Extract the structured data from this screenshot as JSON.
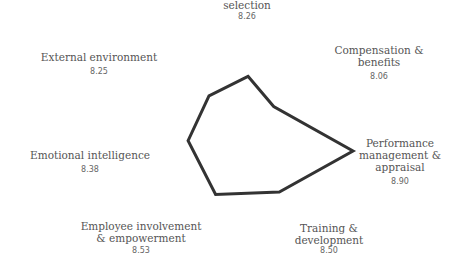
{
  "chart_data": {
    "type": "radar",
    "title": "",
    "categories": [
      "Recruitment & selection",
      "Compensation & benefits",
      "Performance management & appraisal",
      "Training & development",
      "Employee involvement & empowerment",
      "Emotional intelligence",
      "External environment"
    ],
    "series": [
      {
        "name": "Score",
        "values": [
          8.26,
          8.06,
          8.9,
          8.5,
          8.53,
          8.38,
          8.25
        ],
        "color": "#333333"
      }
    ],
    "grid": false,
    "legend": "none"
  },
  "labels": [
    {
      "lines": [
        "selection"
      ],
      "value": "8.26"
    },
    {
      "lines": [
        "Compensation &",
        "benefits"
      ],
      "value": "8.06"
    },
    {
      "lines": [
        "Performance",
        "management &",
        "appraisal"
      ],
      "value": "8.90"
    },
    {
      "lines": [
        "Training &",
        "development"
      ],
      "value": "8.50"
    },
    {
      "lines": [
        "Employee involvement",
        "& empowerment"
      ],
      "value": "8.53"
    },
    {
      "lines": [
        "Emotional intelligence"
      ],
      "value": "8.38"
    },
    {
      "lines": [
        "External environment"
      ],
      "value": "8.25"
    }
  ]
}
